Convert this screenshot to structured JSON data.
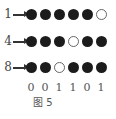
{
  "rows": [
    {
      "label": "1",
      "dots": [
        1,
        1,
        1,
        1,
        1,
        0
      ]
    },
    {
      "label": "4",
      "dots": [
        1,
        1,
        1,
        0,
        1,
        1
      ]
    },
    {
      "label": "8",
      "dots": [
        1,
        1,
        0,
        1,
        1,
        1
      ]
    }
  ],
  "bits": [
    "0",
    "0",
    "1",
    "1",
    "0",
    "1"
  ],
  "caption": "图 5",
  "colors": {
    "filled": "#1c1c1c",
    "empty": "#ffffff",
    "stroke": "#666666"
  }
}
